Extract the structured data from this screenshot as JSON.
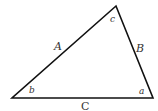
{
  "diagram": {
    "type": "triangle",
    "stroke_color": "#111111",
    "label_color": "#333333",
    "vertices": {
      "top": [
        116,
        6
      ],
      "bottom_left": [
        12,
        98
      ],
      "bottom_right": [
        153,
        98
      ]
    },
    "sides": {
      "left": "A",
      "right": "B",
      "bottom": "C"
    },
    "angles": {
      "top": "c",
      "bottom_left": "b",
      "bottom_right": "a"
    }
  }
}
